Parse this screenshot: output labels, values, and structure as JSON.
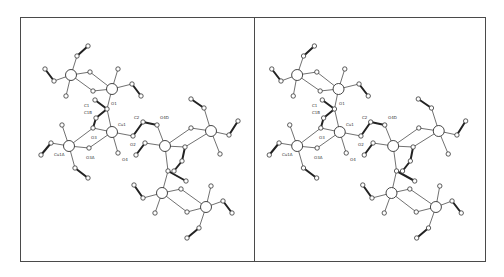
{
  "figure": {
    "type": "stereo-pair crystal structure (ORTEP-style ball-and-stick)",
    "panels": [
      "left-view",
      "right-view"
    ],
    "stereo_shift_px": -6
  },
  "frame": {
    "left": 20,
    "top": 17,
    "right": 486,
    "bottom": 262,
    "divider_x": 254
  },
  "atoms": [
    {
      "id": "a1",
      "x": 71,
      "y": 75,
      "r": 5.5,
      "metal": true
    },
    {
      "id": "a2",
      "x": 112,
      "y": 89,
      "r": 5.5,
      "metal": true
    },
    {
      "id": "a3",
      "x": 112,
      "y": 132,
      "r": 5.5,
      "metal": true,
      "label": "Cu1",
      "lx": 118,
      "ly": 126
    },
    {
      "id": "a4",
      "x": 69,
      "y": 146,
      "r": 5.5,
      "metal": true,
      "label": "Cu1A",
      "lx": 54,
      "ly": 156
    },
    {
      "id": "a5",
      "x": 165,
      "y": 146,
      "r": 5.5,
      "metal": true
    },
    {
      "id": "a6",
      "x": 211,
      "y": 131,
      "r": 5.5,
      "metal": true
    },
    {
      "id": "a7",
      "x": 162,
      "y": 193,
      "r": 5.5,
      "metal": true
    },
    {
      "id": "a8",
      "x": 206,
      "y": 207,
      "r": 5.5,
      "metal": true
    },
    {
      "id": "b1",
      "x": 88,
      "y": 46,
      "r": 2.2
    },
    {
      "id": "b2",
      "x": 77,
      "y": 56,
      "r": 2.2
    },
    {
      "id": "b3",
      "x": 45,
      "y": 69,
      "r": 2.2
    },
    {
      "id": "b4",
      "x": 54,
      "y": 81,
      "r": 2.2
    },
    {
      "id": "b5",
      "x": 66,
      "y": 96,
      "r": 2.2
    },
    {
      "id": "b6",
      "x": 90,
      "y": 72,
      "r": 2.2
    },
    {
      "id": "b7",
      "x": 93,
      "y": 91,
      "r": 2.2
    },
    {
      "id": "b8",
      "x": 118,
      "y": 69,
      "r": 2.2
    },
    {
      "id": "b9",
      "x": 132,
      "y": 84,
      "r": 2.2
    },
    {
      "id": "b10",
      "x": 141,
      "y": 96,
      "r": 2.2
    },
    {
      "id": "b11",
      "x": 107,
      "y": 109,
      "r": 2.2,
      "label": "O1",
      "lx": 111,
      "ly": 105
    },
    {
      "id": "b12",
      "x": 95,
      "y": 100,
      "r": 2.2,
      "label": "C1",
      "lx": 84,
      "ly": 107
    },
    {
      "id": "b13",
      "x": 96,
      "y": 118,
      "r": 2.2,
      "label": "C1B",
      "lx": 84,
      "ly": 114
    },
    {
      "id": "b14",
      "x": 93,
      "y": 128,
      "r": 2.2,
      "label": "O3",
      "lx": 91,
      "ly": 139
    },
    {
      "id": "b15",
      "x": 89,
      "y": 148,
      "r": 2.2,
      "label": "O3A",
      "lx": 86,
      "ly": 159
    },
    {
      "id": "b16",
      "x": 118,
      "y": 153,
      "r": 2.2,
      "label": "O4",
      "lx": 122,
      "ly": 161
    },
    {
      "id": "b17",
      "x": 133,
      "y": 136,
      "r": 2.2,
      "label": "O2",
      "lx": 130,
      "ly": 146
    },
    {
      "id": "b18",
      "x": 143,
      "y": 122,
      "r": 2.2,
      "label": "C2",
      "lx": 134,
      "ly": 119
    },
    {
      "id": "b19",
      "x": 157,
      "y": 125,
      "r": 2.2,
      "label": "O4D",
      "lx": 160,
      "ly": 119
    },
    {
      "id": "b20",
      "x": 62,
      "y": 125,
      "r": 2.2
    },
    {
      "id": "b21",
      "x": 51,
      "y": 143,
      "r": 2.2
    },
    {
      "id": "b22",
      "x": 41,
      "y": 155,
      "r": 2.2
    },
    {
      "id": "b23",
      "x": 75,
      "y": 168,
      "r": 2.2
    },
    {
      "id": "b24",
      "x": 88,
      "y": 178,
      "r": 2.2
    },
    {
      "id": "b25",
      "x": 145,
      "y": 143,
      "r": 2.2
    },
    {
      "id": "b26",
      "x": 136,
      "y": 155,
      "r": 2.2
    },
    {
      "id": "b27",
      "x": 191,
      "y": 99,
      "r": 2.2
    },
    {
      "id": "b28",
      "x": 204,
      "y": 108,
      "r": 2.2
    },
    {
      "id": "b29",
      "x": 191,
      "y": 128,
      "r": 2.2
    },
    {
      "id": "b30",
      "x": 238,
      "y": 121,
      "r": 2.2
    },
    {
      "id": "b31",
      "x": 229,
      "y": 135,
      "r": 2.2
    },
    {
      "id": "b32",
      "x": 220,
      "y": 154,
      "r": 2.2
    },
    {
      "id": "b33",
      "x": 185,
      "y": 147,
      "r": 2.2
    },
    {
      "id": "b34",
      "x": 182,
      "y": 161,
      "r": 2.2
    },
    {
      "id": "b35",
      "x": 168,
      "y": 171,
      "r": 2.2
    },
    {
      "id": "b36",
      "x": 174,
      "y": 171,
      "r": 2.2
    },
    {
      "id": "b37",
      "x": 186,
      "y": 181,
      "r": 2.2
    },
    {
      "id": "b38",
      "x": 134,
      "y": 185,
      "r": 2.2
    },
    {
      "id": "b39",
      "x": 143,
      "y": 198,
      "r": 2.2
    },
    {
      "id": "b40",
      "x": 181,
      "y": 189,
      "r": 2.2
    },
    {
      "id": "b41",
      "x": 155,
      "y": 213,
      "r": 2.2
    },
    {
      "id": "b42",
      "x": 187,
      "y": 212,
      "r": 2.2
    },
    {
      "id": "b43",
      "x": 211,
      "y": 186,
      "r": 2.2
    },
    {
      "id": "b44",
      "x": 223,
      "y": 201,
      "r": 2.2
    },
    {
      "id": "b45",
      "x": 232,
      "y": 213,
      "r": 2.2
    },
    {
      "id": "b46",
      "x": 199,
      "y": 228,
      "r": 2.2
    },
    {
      "id": "b47",
      "x": 187,
      "y": 238,
      "r": 2.2
    }
  ],
  "bonds": [
    [
      "a1",
      "b2",
      0
    ],
    [
      "b2",
      "b1",
      1
    ],
    [
      "a1",
      "b4",
      0
    ],
    [
      "b4",
      "b3",
      1
    ],
    [
      "a1",
      "b5",
      0
    ],
    [
      "a1",
      "b6",
      0
    ],
    [
      "a1",
      "b7",
      0
    ],
    [
      "b6",
      "a2",
      0
    ],
    [
      "b7",
      "a2",
      0
    ],
    [
      "a2",
      "b8",
      0
    ],
    [
      "a2",
      "b9",
      0
    ],
    [
      "b9",
      "b10",
      1
    ],
    [
      "a2",
      "b11",
      0
    ],
    [
      "b11",
      "b12",
      1
    ],
    [
      "b11",
      "a3",
      0
    ],
    [
      "b13",
      "b14",
      1
    ],
    [
      "b11",
      "b13",
      1
    ],
    [
      "a3",
      "b14",
      0
    ],
    [
      "a3",
      "b15",
      0
    ],
    [
      "a3",
      "b16",
      0
    ],
    [
      "a3",
      "b17",
      0
    ],
    [
      "b17",
      "b18",
      1
    ],
    [
      "b18",
      "b19",
      1
    ],
    [
      "b19",
      "a5",
      0
    ],
    [
      "b14",
      "a4",
      0
    ],
    [
      "b15",
      "a4",
      0
    ],
    [
      "a4",
      "b20",
      0
    ],
    [
      "a4",
      "b21",
      0
    ],
    [
      "b21",
      "b22",
      1
    ],
    [
      "a4",
      "b23",
      0
    ],
    [
      "b23",
      "b24",
      1
    ],
    [
      "a5",
      "b25",
      0
    ],
    [
      "b25",
      "b26",
      1
    ],
    [
      "a5",
      "b29",
      0
    ],
    [
      "a5",
      "b33",
      0
    ],
    [
      "b29",
      "a6",
      0
    ],
    [
      "b33",
      "a6",
      0
    ],
    [
      "a6",
      "b28",
      0
    ],
    [
      "b28",
      "b27",
      1
    ],
    [
      "a6",
      "b31",
      0
    ],
    [
      "b31",
      "b30",
      1
    ],
    [
      "a6",
      "b32",
      0
    ],
    [
      "a5",
      "b35",
      0
    ],
    [
      "b33",
      "b34",
      1
    ],
    [
      "b34",
      "b36",
      1
    ],
    [
      "b35",
      "b37",
      1
    ],
    [
      "b35",
      "a7",
      0
    ],
    [
      "a7",
      "b39",
      0
    ],
    [
      "b39",
      "b38",
      1
    ],
    [
      "a7",
      "b40",
      0
    ],
    [
      "a7",
      "b41",
      0
    ],
    [
      "a7",
      "b42",
      0
    ],
    [
      "b40",
      "a8",
      0
    ],
    [
      "b42",
      "a8",
      0
    ],
    [
      "a8",
      "b43",
      0
    ],
    [
      "a8",
      "b44",
      0
    ],
    [
      "b44",
      "b45",
      1
    ],
    [
      "a8",
      "b46",
      0
    ],
    [
      "b46",
      "b47",
      1
    ]
  ],
  "labels": [
    "C1",
    "C1B",
    "O1",
    "Cu1",
    "C2",
    "O4D",
    "O3",
    "O2",
    "O3A",
    "O4",
    "Cu1A"
  ]
}
